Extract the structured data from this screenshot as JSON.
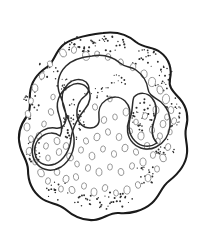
{
  "figure": {
    "title": "Amoeba cell line drawing",
    "subject": "amoeba",
    "style": "black and white ink line drawing with stippling",
    "background_color": "#ffffff",
    "outline_color": "#1a1a1a",
    "inner_outline_color": "#2b2b2b",
    "vacuole_outline_color": "#8d8d8d",
    "granule_color": "#2e2e2e",
    "canvas": {
      "width": 207,
      "height": 245
    },
    "parts": [
      {
        "name": "cell-membrane",
        "label": "Cell membrane (plasmalemma)"
      },
      {
        "name": "endoplasm-boundary",
        "label": "Endoplasm boundary"
      },
      {
        "name": "pseudopod-lobe-left",
        "label": "Left pseudopod lobe"
      },
      {
        "name": "pseudopod-lobe-right",
        "label": "Right pseudopod lobe"
      },
      {
        "name": "granule-field",
        "label": "Stippled granule field"
      },
      {
        "name": "vacuole-field",
        "label": "Vacuoles"
      }
    ],
    "geometry": {
      "membrane_path": "M 103 33 C 117 31 128 35 136 42 C 145 49 152 46 160 52 C 170 59 172 70 170 79 C 168 88 174 92 180 99 C 187 107 189 118 186 128 C 184 137 188 144 187 153 C 186 165 178 174 169 181 C 161 187 160 196 152 203 C 143 211 130 214 119 213 C 110 212 104 219 94 220 C 83 221 73 216 65 209 C 58 203 49 204 41 198 C 32 191 28 180 28 170 C 28 161 22 155 20 146 C 17 135 21 124 27 116 C 32 109 29 101 30 93 C 31 82 38 73 47 67 C 54 62 55 53 62 46 C 70 38 86 35 103 33 Z",
      "endoplasm_path": "M 92 56 C 103 54 113 57 120 63 C 126 68 130 66 136 70 C 143 75 147 82 148 89 C 149 96 155 97 161 102 C 168 108 171 117 170 126 C 169 135 164 143 156 147 C 148 151 139 149 133 143 C 127 137 126 128 129 120 C 131 113 130 106 125 101 C 120 96 112 96 106 100 C 100 104 98 111 99 118 C 100 124 96 128 90 128 C 83 128 78 123 77 116 C 76 108 79 100 85 96 C 90 92 90 86 86 82 C 81 78 73 79 68 84 C 63 89 61 97 63 105 C 66 117 73 126 74 138 C 75 150 70 161 61 167 C 53 172 43 171 37 164 C 31 157 31 147 35 139 C 39 131 47 127 55 128 C 61 129 65 126 66 120 C 67 111 63 103 60 95 C 56 85 58 74 66 66 C 72 60 82 57 92 56 Z",
      "lobe_left_path": "M 70 86 C 76 82 84 83 88 89 C 92 95 90 103 85 109 C 79 116 72 128 71 139 C 70 150 64 160 55 164 C 47 167 39 164 36 157 C 33 150 35 142 41 137 C 47 132 55 132 60 136 C 63 131 62 124 59 115 C 55 104 58 92 70 86 Z",
      "lobe_right_path": "M 134 97 C 139 92 147 92 152 98 C 157 104 157 113 154 121 C 151 130 152 138 157 143 C 150 148 141 147 135 141 C 128 134 128 124 131 115 C 133 108 132 101 134 97 Z"
    },
    "vacuoles": [
      {
        "cx": 63,
        "cy": 53,
        "rx": 3.2,
        "ry": 4.1,
        "rot": -22
      },
      {
        "cx": 74,
        "cy": 50,
        "rx": 2.6,
        "ry": 3.4,
        "rot": 10
      },
      {
        "cx": 86,
        "cy": 56,
        "rx": 3.4,
        "ry": 4.4,
        "rot": -10
      },
      {
        "cx": 97,
        "cy": 54,
        "rx": 2.4,
        "ry": 3.0,
        "rot": 0
      },
      {
        "cx": 108,
        "cy": 57,
        "rx": 2.7,
        "ry": 3.4,
        "rot": 14
      },
      {
        "cx": 121,
        "cy": 62,
        "rx": 2.3,
        "ry": 3.2,
        "rot": -18
      },
      {
        "cx": 133,
        "cy": 67,
        "rx": 2.8,
        "ry": 3.7,
        "rot": 12
      },
      {
        "cx": 144,
        "cy": 74,
        "rx": 3.2,
        "ry": 4.0,
        "rot": -8
      },
      {
        "cx": 152,
        "cy": 82,
        "rx": 3.5,
        "ry": 4.6,
        "rot": 6
      },
      {
        "cx": 160,
        "cy": 90,
        "rx": 3.0,
        "ry": 4.2,
        "rot": -14
      },
      {
        "cx": 166,
        "cy": 99,
        "rx": 3.6,
        "ry": 4.8,
        "rot": 4
      },
      {
        "cx": 171,
        "cy": 110,
        "rx": 2.8,
        "ry": 3.6,
        "rot": -6
      },
      {
        "cx": 174,
        "cy": 121,
        "rx": 2.5,
        "ry": 3.4,
        "rot": 16
      },
      {
        "cx": 170,
        "cy": 132,
        "rx": 2.2,
        "ry": 2.9,
        "rot": 0
      },
      {
        "cx": 50,
        "cy": 64,
        "rx": 2.4,
        "ry": 3.2,
        "rot": -24
      },
      {
        "cx": 42,
        "cy": 76,
        "rx": 2.6,
        "ry": 3.4,
        "rot": 18
      },
      {
        "cx": 35,
        "cy": 88,
        "rx": 2.9,
        "ry": 3.8,
        "rot": -12
      },
      {
        "cx": 31,
        "cy": 101,
        "rx": 2.4,
        "ry": 3.2,
        "rot": 8
      },
      {
        "cx": 28,
        "cy": 114,
        "rx": 2.7,
        "ry": 3.6,
        "rot": -16
      },
      {
        "cx": 27,
        "cy": 127,
        "rx": 3.0,
        "ry": 3.9,
        "rot": 6
      },
      {
        "cx": 31,
        "cy": 139,
        "rx": 2.5,
        "ry": 3.3,
        "rot": -10
      },
      {
        "cx": 29,
        "cy": 151,
        "rx": 2.8,
        "ry": 3.6,
        "rot": 12
      },
      {
        "cx": 35,
        "cy": 162,
        "rx": 2.3,
        "ry": 3.0,
        "rot": 0
      },
      {
        "cx": 41,
        "cy": 173,
        "rx": 3.1,
        "ry": 4.0,
        "rot": -18
      },
      {
        "cx": 48,
        "cy": 181,
        "rx": 2.5,
        "ry": 3.3,
        "rot": 10
      },
      {
        "cx": 57,
        "cy": 172,
        "rx": 2.8,
        "ry": 3.5,
        "rot": -8
      },
      {
        "cx": 66,
        "cy": 179,
        "rx": 3.0,
        "ry": 3.8,
        "rot": 14
      },
      {
        "cx": 76,
        "cy": 177,
        "rx": 2.6,
        "ry": 3.4,
        "rot": -12
      },
      {
        "cx": 61,
        "cy": 189,
        "rx": 2.4,
        "ry": 3.1,
        "rot": 4
      },
      {
        "cx": 72,
        "cy": 190,
        "rx": 2.9,
        "ry": 3.7,
        "rot": -20
      },
      {
        "cx": 84,
        "cy": 186,
        "rx": 2.5,
        "ry": 3.2,
        "rot": 8
      },
      {
        "cx": 94,
        "cy": 192,
        "rx": 3.0,
        "ry": 3.9,
        "rot": -6
      },
      {
        "cx": 105,
        "cy": 188,
        "rx": 2.7,
        "ry": 3.5,
        "rot": 16
      },
      {
        "cx": 116,
        "cy": 193,
        "rx": 2.4,
        "ry": 3.1,
        "rot": -10
      },
      {
        "cx": 127,
        "cy": 190,
        "rx": 3.2,
        "ry": 4.1,
        "rot": 6
      },
      {
        "cx": 138,
        "cy": 185,
        "rx": 2.6,
        "ry": 3.4,
        "rot": -14
      },
      {
        "cx": 148,
        "cy": 178,
        "rx": 2.9,
        "ry": 3.7,
        "rot": 10
      },
      {
        "cx": 157,
        "cy": 169,
        "rx": 2.5,
        "ry": 3.2,
        "rot": 0
      },
      {
        "cx": 163,
        "cy": 158,
        "rx": 3.1,
        "ry": 3.9,
        "rot": -16
      },
      {
        "cx": 168,
        "cy": 147,
        "rx": 2.7,
        "ry": 3.5,
        "rot": 12
      },
      {
        "cx": 158,
        "cy": 141,
        "rx": 2.3,
        "ry": 3.0,
        "rot": -8
      },
      {
        "cx": 147,
        "cy": 146,
        "rx": 2.8,
        "ry": 3.6,
        "rot": 4
      },
      {
        "cx": 136,
        "cy": 152,
        "rx": 2.5,
        "ry": 3.3,
        "rot": -18
      },
      {
        "cx": 125,
        "cy": 148,
        "rx": 3.0,
        "ry": 3.8,
        "rot": 14
      },
      {
        "cx": 114,
        "cy": 154,
        "rx": 2.6,
        "ry": 3.4,
        "rot": -6
      },
      {
        "cx": 103,
        "cy": 149,
        "rx": 2.4,
        "ry": 3.1,
        "rot": 10
      },
      {
        "cx": 92,
        "cy": 156,
        "rx": 2.9,
        "ry": 3.7,
        "rot": -12
      },
      {
        "cx": 81,
        "cy": 150,
        "rx": 2.5,
        "ry": 3.2,
        "rot": 6
      },
      {
        "cx": 70,
        "cy": 157,
        "rx": 3.1,
        "ry": 4.0,
        "rot": -20
      },
      {
        "cx": 59,
        "cy": 152,
        "rx": 2.7,
        "ry": 3.5,
        "rot": 8
      },
      {
        "cx": 48,
        "cy": 158,
        "rx": 2.3,
        "ry": 3.0,
        "rot": -4
      },
      {
        "cx": 97,
        "cy": 137,
        "rx": 3.0,
        "ry": 3.9,
        "rot": 16
      },
      {
        "cx": 108,
        "cy": 132,
        "rx": 2.5,
        "ry": 3.3,
        "rot": -10
      },
      {
        "cx": 119,
        "cy": 137,
        "rx": 2.8,
        "ry": 3.6,
        "rot": 6
      },
      {
        "cx": 130,
        "cy": 131,
        "rx": 2.4,
        "ry": 3.1,
        "rot": -14
      },
      {
        "cx": 141,
        "cy": 136,
        "rx": 3.1,
        "ry": 3.9,
        "rot": 10
      },
      {
        "cx": 152,
        "cy": 130,
        "rx": 2.6,
        "ry": 3.4,
        "rot": -8
      },
      {
        "cx": 163,
        "cy": 124,
        "rx": 2.9,
        "ry": 3.7,
        "rot": 4
      },
      {
        "cx": 86,
        "cy": 141,
        "rx": 2.5,
        "ry": 3.2,
        "rot": -16
      },
      {
        "cx": 104,
        "cy": 120,
        "rx": 2.7,
        "ry": 3.5,
        "rot": 12
      },
      {
        "cx": 115,
        "cy": 117,
        "rx": 2.3,
        "ry": 3.0,
        "rot": -6
      },
      {
        "cx": 126,
        "cy": 112,
        "rx": 2.9,
        "ry": 3.8,
        "rot": 8
      },
      {
        "cx": 95,
        "cy": 107,
        "rx": 2.5,
        "ry": 3.2,
        "rot": -12
      },
      {
        "cx": 110,
        "cy": 99,
        "rx": 2.2,
        "ry": 2.9,
        "rot": 0
      },
      {
        "cx": 145,
        "cy": 116,
        "rx": 2.6,
        "ry": 3.4,
        "rot": 14
      },
      {
        "cx": 156,
        "cy": 110,
        "rx": 3.0,
        "ry": 3.9,
        "rot": -10
      },
      {
        "cx": 167,
        "cy": 117,
        "rx": 2.4,
        "ry": 3.1,
        "rot": 6
      },
      {
        "cx": 51,
        "cy": 112,
        "rx": 2.6,
        "ry": 3.4,
        "rot": -18
      },
      {
        "cx": 44,
        "cy": 124,
        "rx": 2.3,
        "ry": 3.0,
        "rot": 10
      },
      {
        "cx": 39,
        "cy": 136,
        "rx": 2.8,
        "ry": 3.6,
        "rot": -6
      },
      {
        "cx": 46,
        "cy": 146,
        "rx": 2.4,
        "ry": 3.2,
        "rot": 12
      },
      {
        "cx": 57,
        "cy": 141,
        "rx": 2.9,
        "ry": 3.7,
        "rot": -14
      },
      {
        "cx": 88,
        "cy": 168,
        "rx": 2.6,
        "ry": 3.4,
        "rot": 8
      },
      {
        "cx": 99,
        "cy": 172,
        "rx": 3.0,
        "ry": 3.8,
        "rot": -10
      },
      {
        "cx": 110,
        "cy": 167,
        "rx": 2.4,
        "ry": 3.1,
        "rot": 4
      },
      {
        "cx": 121,
        "cy": 172,
        "rx": 2.8,
        "ry": 3.6,
        "rot": -16
      },
      {
        "cx": 132,
        "cy": 166,
        "rx": 2.5,
        "ry": 3.3,
        "rot": 10
      },
      {
        "cx": 143,
        "cy": 162,
        "rx": 3.1,
        "ry": 4.0,
        "rot": -8
      },
      {
        "cx": 153,
        "cy": 155,
        "rx": 2.6,
        "ry": 3.4,
        "rot": 6
      },
      {
        "cx": 77,
        "cy": 164,
        "rx": 2.3,
        "ry": 3.0,
        "rot": -12
      },
      {
        "cx": 66,
        "cy": 146,
        "rx": 2.7,
        "ry": 3.5,
        "rot": 14
      },
      {
        "cx": 136,
        "cy": 122,
        "rx": 2.3,
        "ry": 2.9,
        "rot": 0
      },
      {
        "cx": 160,
        "cy": 136,
        "rx": 2.5,
        "ry": 3.2,
        "rot": -6
      },
      {
        "cx": 53,
        "cy": 97,
        "rx": 2.2,
        "ry": 2.8,
        "rot": 8
      }
    ],
    "granule_clusters": [
      {
        "cx": 95,
        "cy": 44,
        "rx": 34,
        "ry": 9,
        "count": 46,
        "size": 0.85
      },
      {
        "cx": 145,
        "cy": 58,
        "rx": 16,
        "ry": 9,
        "count": 20,
        "size": 0.8
      },
      {
        "cx": 163,
        "cy": 78,
        "rx": 11,
        "ry": 14,
        "count": 22,
        "size": 0.8
      },
      {
        "cx": 173,
        "cy": 112,
        "rx": 9,
        "ry": 16,
        "count": 20,
        "size": 0.8
      },
      {
        "cx": 166,
        "cy": 150,
        "rx": 10,
        "ry": 12,
        "count": 16,
        "size": 0.8
      },
      {
        "cx": 146,
        "cy": 175,
        "rx": 14,
        "ry": 9,
        "count": 16,
        "size": 0.8
      },
      {
        "cx": 103,
        "cy": 200,
        "rx": 30,
        "ry": 9,
        "count": 40,
        "size": 0.85
      },
      {
        "cx": 58,
        "cy": 190,
        "rx": 13,
        "ry": 10,
        "count": 18,
        "size": 0.8
      },
      {
        "cx": 33,
        "cy": 150,
        "rx": 9,
        "ry": 17,
        "count": 20,
        "size": 0.8
      },
      {
        "cx": 31,
        "cy": 105,
        "rx": 8,
        "ry": 15,
        "count": 18,
        "size": 0.8
      },
      {
        "cx": 48,
        "cy": 71,
        "rx": 11,
        "ry": 11,
        "count": 16,
        "size": 0.8
      },
      {
        "cx": 72,
        "cy": 120,
        "rx": 13,
        "ry": 22,
        "count": 40,
        "size": 0.85
      },
      {
        "cx": 144,
        "cy": 118,
        "rx": 12,
        "ry": 19,
        "count": 38,
        "size": 0.85
      },
      {
        "cx": 98,
        "cy": 92,
        "rx": 14,
        "ry": 7,
        "count": 14,
        "size": 0.75
      },
      {
        "cx": 120,
        "cy": 80,
        "rx": 10,
        "ry": 6,
        "count": 10,
        "size": 0.75
      },
      {
        "cx": 64,
        "cy": 85,
        "rx": 9,
        "ry": 7,
        "count": 12,
        "size": 0.75
      }
    ]
  }
}
